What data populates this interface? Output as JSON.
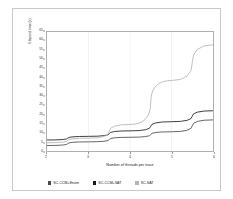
{
  "chart_data": {
    "type": "line",
    "title": "",
    "xlabel": "Number of threads per trace",
    "ylabel": "Elapsed time (s)",
    "x": [
      2,
      3,
      4,
      5,
      6
    ],
    "xlim": [
      2,
      6
    ],
    "ylim": [
      0,
      65
    ],
    "xticks": [
      2,
      3,
      4,
      5,
      6
    ],
    "xtick_labels": [
      "2",
      "3",
      "4",
      "5",
      "6"
    ],
    "yticks": [
      0,
      5,
      10,
      15,
      20,
      25,
      30,
      35,
      40,
      45,
      50,
      55,
      60,
      65
    ],
    "ytick_labels": [
      "0",
      "5",
      "10",
      "15",
      "20",
      "25",
      "30",
      "35",
      "40",
      "45",
      "50",
      "55",
      "60",
      "65"
    ],
    "grid": true,
    "grid_axis": "x",
    "legend_position": "bottom",
    "series": [
      {
        "name": "SC-CCM+Enum",
        "color": "#4a4a4a",
        "values": [
          3.0,
          5.0,
          7.5,
          10.5,
          17.0
        ]
      },
      {
        "name": "SC-CCM+SAT",
        "color": "#1a1a1a",
        "values": [
          6.0,
          8.0,
          11.0,
          16.0,
          22.0
        ]
      },
      {
        "name": "SC-SAT",
        "color": "#b4b4b4",
        "values": [
          4.5,
          7.0,
          14.5,
          38.5,
          58.0
        ]
      }
    ]
  },
  "axes": {
    "y_title": "Elapsed time (s)",
    "x_title": "Number of threads per trace"
  },
  "legend": {
    "items": [
      {
        "label": "SC-CCM+Enum",
        "swatch_color": "#4a4a4a",
        "icon": "square-marker-icon"
      },
      {
        "label": "SC-CCM+SAT",
        "swatch_color": "#1a1a1a",
        "icon": "square-marker-icon"
      },
      {
        "label": "SC-SAT",
        "swatch_color": "#b4b4b4",
        "icon": "square-marker-icon"
      }
    ]
  },
  "colors": {
    "plot_border": "#b0b0b0",
    "outer_border": "#c8c8c8",
    "gridline": "#ededed",
    "background": "#ffffff"
  }
}
